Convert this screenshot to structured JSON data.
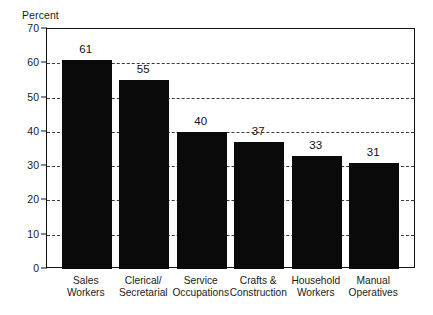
{
  "chart_data": {
    "type": "bar",
    "title": "",
    "subtitle": "",
    "xlabel": "",
    "ylabel": "Percent",
    "ylim": [
      0,
      70
    ],
    "ytick_step": 10,
    "yticks": [
      0,
      10,
      20,
      30,
      40,
      50,
      60,
      70
    ],
    "ytick_labels": [
      "0",
      "10",
      "20",
      "30",
      "40",
      "50",
      "60",
      "70"
    ],
    "grid": "horizontal-dashed",
    "legend": "none",
    "bar_color": "#0a0a0a",
    "categories": [
      "Sales Workers",
      "Clerical/ Secretarial",
      "Service Occupations",
      "Crafts & Construction",
      "Household Workers",
      "Manual Operatives"
    ],
    "category_lines": [
      [
        "Sales",
        "Workers"
      ],
      [
        "Clerical/",
        "Secretarial"
      ],
      [
        "Service",
        "Occupations"
      ],
      [
        "Crafts &",
        "Construction"
      ],
      [
        "Household",
        "Workers"
      ],
      [
        "Manual",
        "Operatives"
      ]
    ],
    "values": [
      61,
      55,
      40,
      37,
      33,
      31
    ],
    "value_labels": [
      "61",
      "55",
      "40",
      "37",
      "33",
      "31"
    ]
  }
}
